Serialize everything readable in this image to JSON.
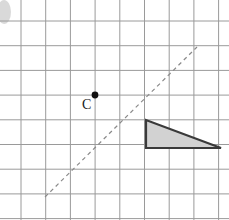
{
  "figure": {
    "width": 229,
    "height": 220,
    "background": "#ffffff"
  },
  "grid": {
    "line_color": "#9a9a9a",
    "line_width": 1,
    "spacing": 24.7,
    "origin_x": 21,
    "origin_y": 21,
    "columns": 9,
    "rows": 8,
    "vertical_x": [
      21,
      45.7,
      70.4,
      95.1,
      119.8,
      144.5,
      169.2,
      193.9,
      218.6
    ],
    "horizontal_y": [
      21,
      45.7,
      70.4,
      95.1,
      119.8,
      144.5,
      169.2,
      193.9,
      218.6
    ]
  },
  "point_c": {
    "label": "C",
    "x": 95,
    "y": 95,
    "radius": 3.4,
    "color": "#111111",
    "label_x": 82,
    "label_y": 98
  },
  "dashed_line": {
    "name": "line-of-reflection",
    "x1": 45,
    "y1": 197,
    "x2": 197,
    "y2": 47,
    "color": "#8a8a8a",
    "width": 1.2,
    "dash": "4 3.5",
    "slope": 1
  },
  "triangle": {
    "name": "shaded-right-triangle",
    "vertices": [
      {
        "label": "top-left",
        "x": 146,
        "y": 120
      },
      {
        "label": "bottom-left",
        "x": 146,
        "y": 148
      },
      {
        "label": "bottom-right",
        "x": 221,
        "y": 148
      }
    ],
    "fill": "#d2d2d2",
    "stroke": "#3a3a3a",
    "stroke_width": 2.2,
    "points_attr": "146,120 146,148 221,148"
  },
  "corner_artifact": {
    "name": "page-edge-smudge",
    "x": 4,
    "y": 12,
    "rx": 7,
    "ry": 12,
    "color": "#b9b9b9"
  }
}
